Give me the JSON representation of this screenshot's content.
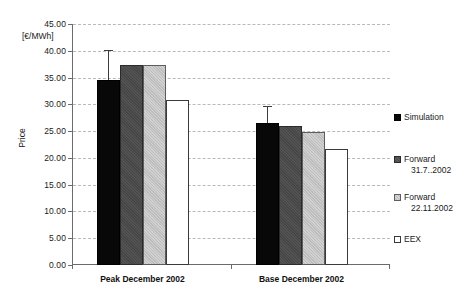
{
  "chart_data": {
    "type": "bar",
    "title": "",
    "subtitle": "",
    "xlabel": "",
    "ylabel": "Price",
    "yunit": "[€/MWh]",
    "ylim": [
      0,
      45
    ],
    "ytick_step": 5,
    "grid": true,
    "legend_position": "right",
    "categories": [
      "Peak December 2002",
      "Base December 2002"
    ],
    "ytick_labels": [
      "0.00",
      "5.00",
      "10.00",
      "15.00",
      "20.00",
      "25.00",
      "30.00",
      "35.00",
      "40.00",
      "45.00"
    ],
    "series": [
      {
        "name": "Simulation",
        "color": "#080808",
        "values": [
          34.5,
          26.6
        ],
        "error_low": [
          34.5,
          26.6
        ],
        "error_high": [
          40.2,
          29.6
        ]
      },
      {
        "name": "Forward 31.7..2002",
        "name_line1": "Forward",
        "name_line2": "31.7..2002",
        "color": "#464646",
        "values": [
          37.3,
          26.0
        ]
      },
      {
        "name": "Forward 22.11.2002",
        "name_line1": "Forward",
        "name_line2": "22.11.2002",
        "color": "#bdbdbd",
        "values": [
          37.4,
          24.8
        ]
      },
      {
        "name": "EEX",
        "name_line1": "EEX",
        "name_line2": "",
        "color": "#ffffff",
        "values": [
          30.9,
          21.6
        ]
      }
    ]
  },
  "axes": {
    "y_unit_label": "[€/MWh]",
    "y_axis_title": "Price"
  },
  "legend": {
    "items": [
      {
        "label": "Simulation",
        "line1": "Simulation",
        "line2": ""
      },
      {
        "label": "Forward 31.7..2002",
        "line1": "Forward",
        "line2": "31.7..2002"
      },
      {
        "label": "Forward 22.11.2002",
        "line1": "Forward",
        "line2": "22.11.2002"
      },
      {
        "label": "EEX",
        "line1": "EEX",
        "line2": ""
      }
    ]
  }
}
